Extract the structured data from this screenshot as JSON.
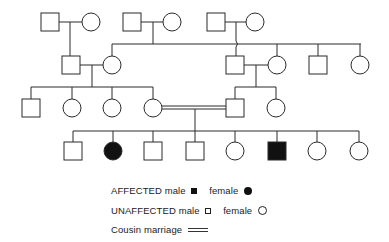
{
  "diagram": {
    "type": "pedigree",
    "generations": [
      {
        "level": 1,
        "couples": [
          {
            "male": {
              "affected": false
            },
            "female": {
              "affected": false
            }
          },
          {
            "male": {
              "affected": false
            },
            "female": {
              "affected": false
            }
          },
          {
            "male": {
              "affected": false
            },
            "female": {
              "affected": false
            }
          }
        ]
      },
      {
        "level": 2,
        "members": [
          "male",
          "female (spouse)",
          "male",
          "female (spouse)",
          "male",
          "female"
        ]
      },
      {
        "level": 3,
        "members": [
          "male",
          "female",
          "female",
          "female",
          "male",
          "female"
        ],
        "cousin_marriage": "female (4th) x male (5th)"
      },
      {
        "level": 4,
        "members": [
          {
            "sex": "male",
            "affected": false
          },
          {
            "sex": "female",
            "affected": true
          },
          {
            "sex": "male",
            "affected": false
          },
          {
            "sex": "male",
            "affected": false
          },
          {
            "sex": "female",
            "affected": false
          },
          {
            "sex": "male",
            "affected": true
          },
          {
            "sex": "female",
            "affected": false
          },
          {
            "sex": "female",
            "affected": false
          }
        ]
      }
    ]
  },
  "legend": {
    "affected_label": "AFFECTED",
    "unaffected_label": "UNAFFECTED",
    "male_label": "male",
    "female_label": "female",
    "cousin_label": "Cousin  marriage"
  },
  "colors": {
    "line": "#2a2a2a",
    "fill_affected": "#111111",
    "background": "#ffffff"
  }
}
